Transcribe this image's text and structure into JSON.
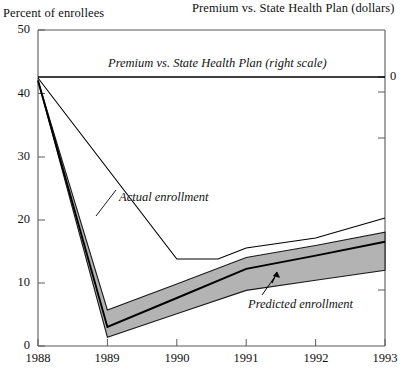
{
  "axes": {
    "left_title": "Percent of enrollees",
    "right_title": "Premium vs. State Health Plan (dollars)",
    "y_left_ticks": [
      "0",
      "10",
      "20",
      "30",
      "40",
      "50"
    ],
    "y_right_ticks": [
      "0"
    ],
    "x_ticks": [
      "1988",
      "1989",
      "1990",
      "1991",
      "1992",
      "1993"
    ]
  },
  "labels": {
    "premium_line": "Premium vs. State Health Plan (right scale)",
    "actual_line": "Actual enrollment",
    "predicted_band": "Predicted enrollment"
  },
  "colors": {
    "line": "#000000",
    "band_fill": "#b3b3b3",
    "axis": "#555555",
    "background": "#ffffff"
  },
  "chart_data": {
    "type": "line",
    "title": "",
    "xlabel": "",
    "ylabel": "Percent of enrollees",
    "y2label": "Premium vs. State Health Plan (dollars)",
    "x": [
      "1988",
      "1989",
      "1990",
      "1991",
      "1992",
      "1993"
    ],
    "xlim": [
      1988,
      1993
    ],
    "ylim": [
      0,
      50
    ],
    "y2lim": [
      -30,
      5
    ],
    "grid": false,
    "legend": "inline-annotations",
    "series": [
      {
        "name": "Premium vs. State Health Plan (right scale)",
        "axis": "right",
        "values": [
          0,
          0,
          0,
          0,
          0,
          0
        ],
        "style": "solid-thin",
        "note": "flat at 0 on the right scale across full span"
      },
      {
        "name": "Actual enrollment",
        "axis": "left",
        "values": [
          42,
          20.5,
          13.7,
          13.7,
          15.6,
          20.2
        ],
        "style": "solid-thin",
        "note": "steep decline 1988-1990, flat 1990-1991, gentle rise to 1993"
      },
      {
        "name": "Predicted enrollment (central)",
        "axis": "left",
        "values": [
          42,
          3.0,
          7.6,
          12.2,
          14.3,
          16.5
        ],
        "style": "solid-medium"
      },
      {
        "name": "Predicted enrollment (upper bound)",
        "axis": "left",
        "values": [
          42,
          5.7,
          9.8,
          14.0,
          15.9,
          18.0
        ],
        "style": "band-edge"
      },
      {
        "name": "Predicted enrollment (lower bound)",
        "axis": "left",
        "values": [
          42,
          1.4,
          5.1,
          8.8,
          10.4,
          12.0
        ],
        "style": "band-edge"
      }
    ],
    "annotations": [
      {
        "text": "Actual enrollment",
        "x": 1989.6,
        "y": 23.5
      },
      {
        "text": "Predicted enrollment",
        "x": 1991.5,
        "y": 6.5,
        "arrow_to": [
          1991.25,
          13.0
        ]
      },
      {
        "text": "Premium vs. State Health Plan (right scale)",
        "x": 1989.0,
        "y": 45.2
      }
    ]
  }
}
